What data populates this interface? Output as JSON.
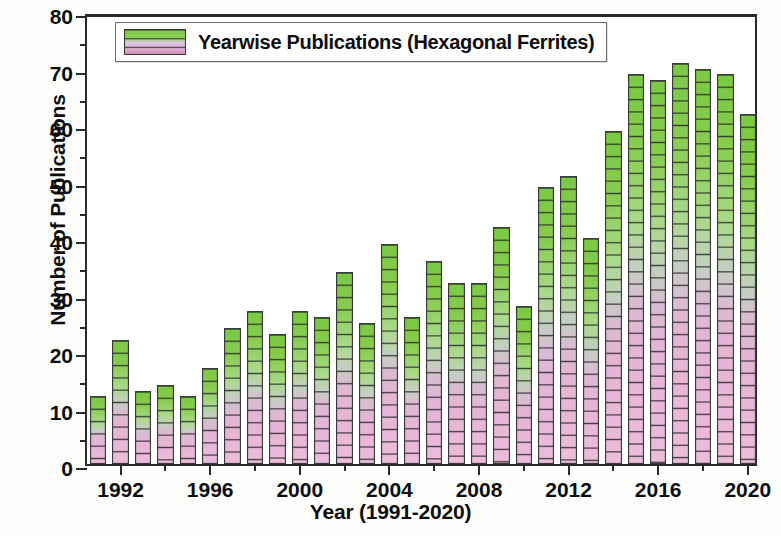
{
  "chart_data": {
    "type": "bar",
    "title": "",
    "xlabel": "Year (1991-2020)",
    "ylabel": "Number of Publications",
    "legend": [
      "Yearwise Publications (Hexagonal Ferrites)"
    ],
    "legend_position": "top-left-inside",
    "grid": false,
    "ylim": [
      0,
      80
    ],
    "ytick_step": 10,
    "yminor_step": 5,
    "ytick_labels": [
      "0",
      "10",
      "20",
      "30",
      "40",
      "50",
      "60",
      "70",
      "80"
    ],
    "xtick_labels": [
      "1992",
      "1996",
      "2000",
      "2004",
      "2008",
      "2012",
      "2016",
      "2020"
    ],
    "xlim": [
      1990.5,
      2020.5
    ],
    "categories": [
      "1991",
      "1992",
      "1993",
      "1994",
      "1995",
      "1996",
      "1997",
      "1998",
      "1999",
      "2000",
      "2001",
      "2002",
      "2003",
      "2004",
      "2005",
      "2006",
      "2007",
      "2008",
      "2009",
      "2010",
      "2011",
      "2012",
      "2013",
      "2014",
      "2015",
      "2016",
      "2017",
      "2018",
      "2019",
      "2020"
    ],
    "values": [
      12,
      22,
      13,
      14,
      12,
      17,
      24,
      27,
      23,
      27,
      26,
      34,
      25,
      39,
      26,
      36,
      32,
      32,
      42,
      28,
      49,
      51,
      40,
      59,
      69,
      68,
      71,
      70,
      69,
      62
    ],
    "bar_colors": {
      "top": "#7ac943",
      "mid": "#c3cfc0",
      "bottom": "#e9b7d8",
      "outline": "#3a3a3a"
    },
    "axis_color": "#2a2a2a",
    "background": "#ffffff"
  }
}
